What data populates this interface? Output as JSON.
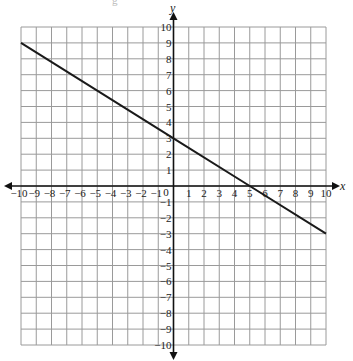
{
  "caption_fragment": "g",
  "chart_data": {
    "type": "line",
    "title": "",
    "xlabel": "x",
    "ylabel": "y",
    "xlim": [
      -10,
      10
    ],
    "ylim": [
      -10,
      10
    ],
    "grid": true,
    "x_ticks": [
      -10,
      -9,
      -8,
      -7,
      -6,
      -5,
      -4,
      -3,
      -2,
      -1,
      1,
      2,
      3,
      4,
      5,
      6,
      7,
      8,
      9,
      10
    ],
    "y_ticks": [
      -10,
      -9,
      -8,
      -7,
      -6,
      -5,
      -4,
      -3,
      -2,
      -1,
      1,
      2,
      3,
      4,
      5,
      6,
      7,
      8,
      9,
      10
    ],
    "origin_label": "0",
    "series": [
      {
        "name": "line",
        "equation": "y = -0.6x + 3",
        "slope": -0.6,
        "intercept": 3,
        "x": [
          -10,
          0,
          5,
          10
        ],
        "y": [
          9,
          3,
          0,
          -3
        ]
      }
    ]
  },
  "colors": {
    "grid": "#9a9a9a",
    "axis": "#111111",
    "line": "#1a1a1a",
    "text": "#222222"
  }
}
